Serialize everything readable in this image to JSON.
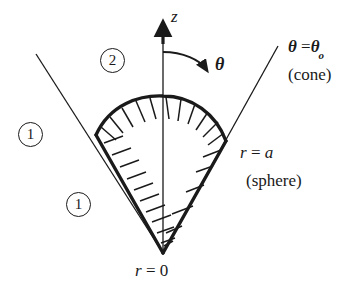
{
  "figure": {
    "background_color": "#ffffff",
    "stroke_color": "#1a1a1a",
    "axis": {
      "name": "z-axis",
      "label": "z",
      "arrow_direction": "up"
    },
    "angle_arrow": {
      "label": "θ",
      "description": "curved arrow from z-axis sweeping clockwise toward the cone surface"
    },
    "boundaries": {
      "cone": {
        "equation": "θ = θ",
        "equation_lhs": "θ",
        "equation_rhs": "θ",
        "subscript": "o",
        "caption": "(cone)"
      },
      "sphere": {
        "equation_lhs": "r",
        "equation_rhs": "a",
        "equation": "r = a",
        "caption": "(sphere)"
      },
      "origin": {
        "equation_lhs": "r",
        "equation_rhs": "0",
        "equation": "r = 0"
      }
    },
    "regions": [
      {
        "id": "region-1-left",
        "label": "1",
        "position": "upper-left outside cone"
      },
      {
        "id": "region-1-lower",
        "label": "1",
        "position": "lower-left outside cone"
      },
      {
        "id": "region-2-top",
        "label": "2",
        "position": "top, between cone and z-axis"
      }
    ],
    "hatching": {
      "description": "short tick marks drawn inside the wedge boundary indicating the enclosed spherical-sector volume",
      "edges": [
        "left cone generator",
        "spherical cap arc",
        "right cone generator"
      ]
    },
    "geometry": {
      "apex": {
        "x": 163,
        "y": 253
      },
      "arc_top": {
        "x": 163,
        "y": 97
      },
      "arc_left_end": {
        "x": 96,
        "y": 135
      },
      "arc_right_end": {
        "x": 226,
        "y": 141
      },
      "cone_left_outer_end": {
        "x": 36,
        "y": 54
      },
      "cone_right_outer_end": {
        "x": 278,
        "y": 46
      },
      "z_arrow_tip": {
        "x": 163,
        "y": 22
      }
    }
  }
}
